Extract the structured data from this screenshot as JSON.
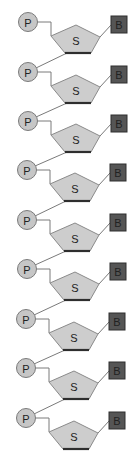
{
  "diagram": {
    "type": "nucleic-acid-strand",
    "unit_count": 9,
    "labels": {
      "phosphate": "P",
      "sugar": "S",
      "base": "B"
    },
    "colors": {
      "background": "#ffffff",
      "phosphate_fill": "#c6c6c6",
      "phosphate_stroke": "#7a7a7a",
      "sugar_fill": "#cdcdcd",
      "sugar_stroke": "#8a8a8a",
      "sugar_bottom_edge": "#2e2e2e",
      "base_fill": "#555555",
      "base_stroke": "#2e2e2e",
      "bond_line": "#7a7a7a",
      "text": "#222222"
    },
    "units": [
      {
        "index": 1,
        "phosphate": "P",
        "sugar": "S",
        "base": "B",
        "y": 22,
        "dx": 0
      },
      {
        "index": 2,
        "phosphate": "P",
        "sugar": "S",
        "base": "B",
        "y": 72,
        "dx": 0
      },
      {
        "index": 3,
        "phosphate": "P",
        "sugar": "S",
        "base": "B",
        "y": 121,
        "dx": 0
      },
      {
        "index": 4,
        "phosphate": "P",
        "sugar": "S",
        "base": "B",
        "y": 170,
        "dx": -1
      },
      {
        "index": 5,
        "phosphate": "P",
        "sugar": "S",
        "base": "B",
        "y": 220,
        "dx": -1
      },
      {
        "index": 6,
        "phosphate": "P",
        "sugar": "S",
        "base": "B",
        "y": 269,
        "dx": -1
      },
      {
        "index": 7,
        "phosphate": "P",
        "sugar": "S",
        "base": "B",
        "y": 319,
        "dx": -2
      },
      {
        "index": 8,
        "phosphate": "P",
        "sugar": "S",
        "base": "B",
        "y": 368,
        "dx": -2
      },
      {
        "index": 9,
        "phosphate": "P",
        "sugar": "S",
        "base": "B",
        "y": 418,
        "dx": -2
      }
    ]
  }
}
